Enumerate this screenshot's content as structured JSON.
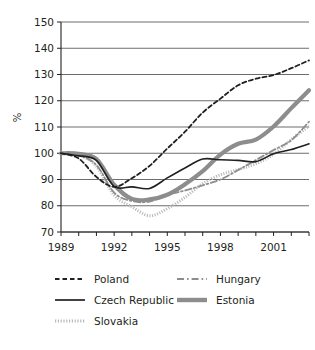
{
  "chart_data": {
    "type": "line",
    "title": "",
    "xlabel": "",
    "ylabel": "%",
    "xlim": [
      1989,
      2003
    ],
    "ylim": [
      70,
      150
    ],
    "ytick_values": [
      70,
      80,
      90,
      100,
      110,
      120,
      130,
      140,
      150
    ],
    "ytick_labels": [
      "70",
      "80",
      "90",
      "100",
      "110",
      "120",
      "130",
      "140",
      "150"
    ],
    "xtick_values": [
      1989,
      1990,
      1991,
      1992,
      1993,
      1994,
      1995,
      1996,
      1997,
      1998,
      1999,
      2000,
      2001,
      2002,
      2003
    ],
    "xtick_labels_shown": [
      "1989",
      "1992",
      "1995",
      "1998",
      "2001"
    ],
    "xtick_labels_shown_values": [
      1989,
      1992,
      1995,
      1998,
      2001
    ],
    "grid": "horizontal",
    "legend_position": "below",
    "x": [
      1989,
      1990,
      1991,
      1992,
      1993,
      1994,
      1995,
      1996,
      1997,
      1998,
      1999,
      2000,
      2001,
      2002,
      2003
    ],
    "series": [
      {
        "name": "Poland",
        "style": "dashed",
        "color": "#231f20",
        "width": 1.8,
        "values": [
          100,
          98.0,
          91.0,
          87.2,
          90.5,
          95.2,
          101.8,
          108.2,
          115.5,
          120.8,
          125.9,
          128.4,
          129.8,
          132.4,
          135.4
        ]
      },
      {
        "name": "Czech Republic",
        "style": "solid",
        "color": "#231f20",
        "width": 1.6,
        "values": [
          100,
          99.0,
          97.3,
          87.4,
          87.2,
          86.6,
          90.6,
          94.4,
          97.8,
          97.5,
          97.3,
          96.8,
          99.8,
          101.4,
          103.6
        ]
      },
      {
        "name": "Slovakia",
        "style": "dotted",
        "color": "#b9b9b9",
        "width": 3.0,
        "values": [
          100,
          99.5,
          95.0,
          84.0,
          79.6,
          76.2,
          78.9,
          83.2,
          88.4,
          91.8,
          93.8,
          96.0,
          99.6,
          105.2,
          110.4
        ]
      },
      {
        "name": "Hungary",
        "style": "dashdot",
        "color": "#8d8d8d",
        "width": 1.8,
        "values": [
          100,
          99.2,
          95.5,
          85.0,
          81.8,
          81.6,
          84.2,
          85.8,
          87.8,
          90.0,
          93.6,
          97.4,
          101.2,
          105.0,
          112.0
        ]
      },
      {
        "name": "Estonia",
        "style": "solid",
        "color": "#8d8d8d",
        "width": 4.2,
        "values": [
          100,
          99.8,
          97.8,
          88.0,
          82.6,
          82.4,
          84.2,
          88.2,
          93.2,
          99.5,
          103.6,
          105.2,
          110.2,
          117.2,
          124.0
        ]
      }
    ]
  },
  "legend": {
    "items": [
      {
        "label": "Poland",
        "style": "dashed"
      },
      {
        "label": "Hungary",
        "style": "dashdot"
      },
      {
        "label": "Czech Republic",
        "style": "solid"
      },
      {
        "label": "Estonia",
        "style": "thick"
      },
      {
        "label": "Slovakia",
        "style": "dotted"
      }
    ]
  }
}
